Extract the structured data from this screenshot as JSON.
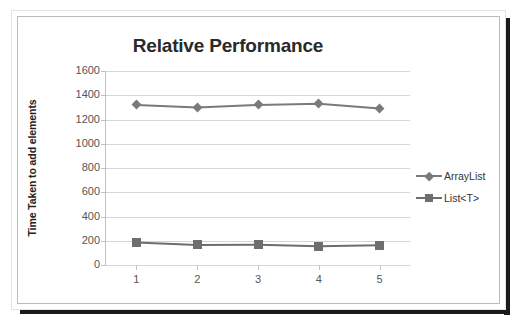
{
  "chart_data": {
    "type": "line",
    "title": "Relative Performance",
    "xlabel": "",
    "ylabel": "Time Taken to add elements",
    "x": [
      1,
      2,
      3,
      4,
      5
    ],
    "categories": [
      "1",
      "2",
      "3",
      "4",
      "5"
    ],
    "series": [
      {
        "name": "ArrayList",
        "marker": "diamond",
        "color": "#7a7a7a",
        "values": [
          1320,
          1300,
          1320,
          1330,
          1290
        ]
      },
      {
        "name": "List<T>",
        "marker": "square",
        "color": "#6e6e6e",
        "values": [
          185,
          165,
          168,
          155,
          163
        ]
      }
    ],
    "ylim": [
      0,
      1600
    ],
    "yticks": [
      0,
      200,
      400,
      600,
      800,
      1000,
      1200,
      1400,
      1600
    ],
    "ytick_labels": [
      "0",
      "200",
      "400",
      "600",
      "800",
      "1000",
      "1200",
      "1400",
      "1600"
    ],
    "xtick_labels": [
      "1",
      "2",
      "3",
      "4",
      "5"
    ],
    "grid": "horizontal",
    "legend_position": "right",
    "legend_entries": [
      "ArrayList",
      "List<T>"
    ]
  },
  "figure": {
    "title": "Relative Performance",
    "axis_title_y": "Time Taken to add elements"
  }
}
